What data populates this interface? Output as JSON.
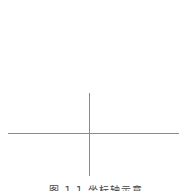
{
  "diagram": {
    "type": "coordinate-axes",
    "line_color": "#8a8a8a",
    "horizontal_axis": {
      "x1": 8,
      "x2": 179,
      "y": 133
    },
    "vertical_axis": {
      "x": 89,
      "y1": 93,
      "y2": 176
    }
  },
  "caption": {
    "text": "图 1.1   坐标轴示意"
  }
}
